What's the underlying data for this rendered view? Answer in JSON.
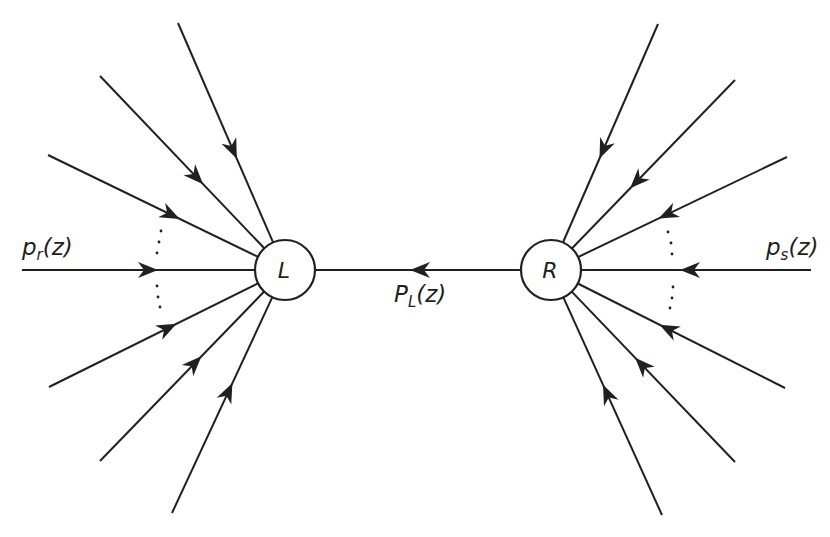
{
  "diagram": {
    "stroke_color": "#231f20",
    "background": "#ffffff",
    "nodes": [
      {
        "id": "L",
        "label": "L",
        "cx": 285,
        "cy": 270,
        "r": 30
      },
      {
        "id": "R",
        "label": "R",
        "cx": 551,
        "cy": 270,
        "r": 30
      }
    ],
    "labels": {
      "left_input": {
        "main": "p",
        "sub": "r",
        "tail": "(z)"
      },
      "right_input": {
        "main": "p",
        "sub": "s",
        "tail": "(z)"
      },
      "middle": {
        "main": "P",
        "sub": "L",
        "tail": "(z)"
      }
    },
    "edges_left": [
      {
        "from": [
          178,
          23
        ],
        "arrow": [
          232,
          150
        ]
      },
      {
        "from": [
          100,
          76
        ],
        "arrow": [
          193,
          180
        ]
      },
      {
        "from": [
          48,
          155
        ],
        "arrow": [
          170,
          216
        ]
      },
      {
        "from": [
          22,
          270
        ],
        "arrow": [
          148,
          270
        ]
      },
      {
        "from": [
          49,
          387
        ],
        "arrow": [
          168,
          329
        ]
      },
      {
        "from": [
          100,
          461
        ],
        "arrow": [
          195,
          364
        ]
      },
      {
        "from": [
          172,
          513
        ],
        "arrow": [
          230,
          393
        ]
      }
    ],
    "edges_right": [
      {
        "from": [
          658,
          24
        ],
        "arrow": [
          605,
          150
        ]
      },
      {
        "from": [
          735,
          80
        ],
        "arrow": [
          637,
          181
        ]
      },
      {
        "from": [
          787,
          157
        ],
        "arrow": [
          668,
          215
        ]
      },
      {
        "from": [
          811,
          270
        ],
        "arrow": [
          690,
          270
        ]
      },
      {
        "from": [
          785,
          388
        ],
        "arrow": [
          668,
          330
        ]
      },
      {
        "from": [
          735,
          462
        ],
        "arrow": [
          641,
          366
        ]
      },
      {
        "from": [
          662,
          515
        ],
        "arrow": [
          607,
          394
        ]
      }
    ],
    "edge_middle": {
      "from": [
        521,
        270
      ],
      "to": [
        315,
        270
      ],
      "arrow": [
        420,
        270
      ]
    },
    "ellipsis_dots": [
      [
        161,
        231
      ],
      [
        159,
        242
      ],
      [
        157,
        253
      ],
      [
        157,
        286
      ],
      [
        158,
        297
      ],
      [
        160,
        307
      ],
      [
        668,
        232
      ],
      [
        671,
        243
      ],
      [
        672,
        254
      ],
      [
        673,
        287
      ],
      [
        672,
        298
      ],
      [
        670,
        308
      ]
    ]
  }
}
